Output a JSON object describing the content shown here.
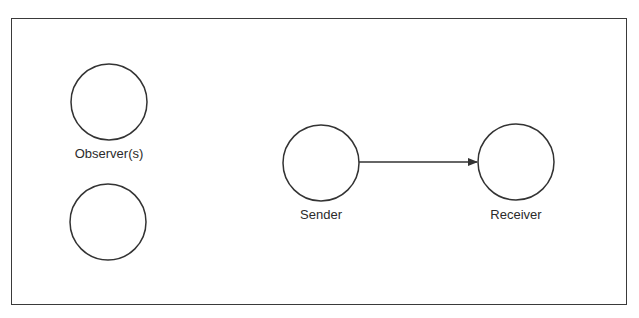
{
  "diagram": {
    "type": "communication-model",
    "nodes": [
      {
        "id": "observer-1",
        "label": "Observer(s)",
        "cx": 109,
        "cy": 102,
        "r": 38,
        "label_x": 109,
        "label_y": 147
      },
      {
        "id": "observer-2",
        "label": "",
        "cx": 108,
        "cy": 222,
        "r": 38
      },
      {
        "id": "sender",
        "label": "Sender",
        "cx": 321,
        "cy": 163,
        "r": 38,
        "label_x": 321,
        "label_y": 208
      },
      {
        "id": "receiver",
        "label": "Receiver",
        "cx": 516,
        "cy": 162,
        "r": 38,
        "label_x": 516,
        "label_y": 208
      }
    ],
    "edges": [
      {
        "from": "sender",
        "to": "receiver",
        "directed": true
      }
    ],
    "colors": {
      "stroke": "#333333",
      "background": "#ffffff"
    }
  },
  "labels": {
    "observer": "Observer(s)",
    "sender": "Sender",
    "receiver": "Receiver"
  }
}
